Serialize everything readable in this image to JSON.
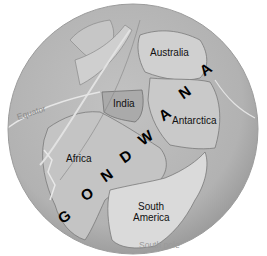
{
  "map": {
    "title": "GONDWANA",
    "title_letters": [
      "G",
      "O",
      "N",
      "D",
      "W",
      "A",
      "N",
      "A"
    ],
    "labels": {
      "australia": "Australia",
      "india": "India",
      "antarctica": "Antarctica",
      "africa": "Africa",
      "south_america_line1": "South",
      "south_america_line2": "America",
      "equator": "Equator",
      "south_pole": "South pole"
    },
    "colors": {
      "ocean": "#b4b4b4",
      "ocean_edge": "#9a9a9a",
      "land": "#c8c8c8",
      "land_light": "#d8d8d8",
      "india": "#a8a8a8",
      "outline": "#7a7a7a",
      "text": "#111111",
      "equator_line": "#e6e6e6"
    }
  }
}
